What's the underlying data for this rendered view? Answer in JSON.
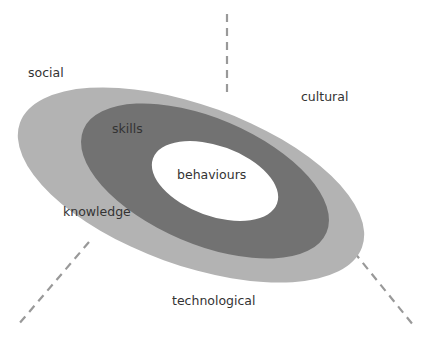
{
  "diagram": {
    "colors": {
      "outer_ring": "#b3b3b3",
      "middle_ring": "#727272",
      "inner_core": "#ffffff",
      "axis_line": "#999999",
      "text": "#333333"
    },
    "rings": [
      {
        "name": "knowledge",
        "label": "knowledge"
      },
      {
        "name": "skills",
        "label": "skills"
      },
      {
        "name": "behaviours",
        "label": "behaviours"
      }
    ],
    "contexts": [
      {
        "name": "social",
        "label": "social"
      },
      {
        "name": "cultural",
        "label": "cultural"
      },
      {
        "name": "technological",
        "label": "technological"
      }
    ]
  }
}
